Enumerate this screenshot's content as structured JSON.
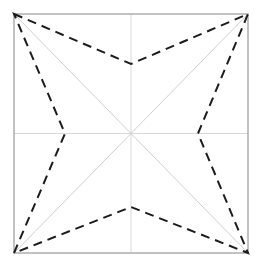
{
  "figure": {
    "type": "geometric-diagram",
    "canvas": {
      "width": 259,
      "height": 270,
      "background": "#ffffff"
    },
    "colors": {
      "background": "#ffffff",
      "square_border": "#9a9a9a",
      "diagonal_guide": "#cfcfcf",
      "axis_guide": "#d8d8d8",
      "dashed_star": "#1c1c1c"
    },
    "square": {
      "label": "bounding-square",
      "left": 14,
      "top": 14,
      "right": 248,
      "bottom": 253,
      "stroke_width": 1.2
    },
    "center": {
      "x": 131,
      "y": 133.5
    },
    "guides": {
      "diagonals": [
        {
          "label": "diagonal-tl-br",
          "x1": 14,
          "y1": 14,
          "x2": 248,
          "y2": 253
        },
        {
          "label": "diagonal-tr-bl",
          "x1": 248,
          "y1": 14,
          "x2": 14,
          "y2": 253
        }
      ],
      "axes": [
        {
          "label": "horizontal-center-line",
          "x1": 14,
          "y1": 133.5,
          "x2": 248,
          "y2": 133.5
        },
        {
          "label": "vertical-center-line",
          "x1": 131,
          "y1": 14,
          "x2": 131,
          "y2": 253
        }
      ]
    },
    "star": {
      "label": "dashed-four-pointed-star",
      "outer_points": [
        {
          "name": "corner-top-left",
          "x": 14,
          "y": 14
        },
        {
          "name": "corner-top-right",
          "x": 248,
          "y": 14
        },
        {
          "name": "corner-bottom-right",
          "x": 248,
          "y": 253
        },
        {
          "name": "corner-bottom-left",
          "x": 14,
          "y": 253
        }
      ],
      "inner_points": [
        {
          "name": "inner-top",
          "x": 131,
          "y": 64
        },
        {
          "name": "inner-right",
          "x": 198,
          "y": 133.5
        },
        {
          "name": "inner-bottom",
          "x": 131,
          "y": 207
        },
        {
          "name": "inner-left",
          "x": 65,
          "y": 133.5
        }
      ],
      "dash_pattern": "9 6",
      "stroke_width": 2.0,
      "path": "M 14 14 L 131 64 L 248 14 L 198 133.5 L 248 253 L 131 207 L 14 253 L 65 133.5 Z"
    }
  },
  "chart_data": {
    "type": "scatter",
    "xlabel": "",
    "ylabel": "",
    "xlim": [
      14,
      248
    ],
    "ylim": [
      14,
      253
    ],
    "grid": false,
    "legend": "none",
    "annotations": [
      "Outer vertices coincide with the square corners",
      "Inner vertices lie on the horizontal and vertical center lines",
      "Star outline drawn with a dashed black stroke",
      "Light gray guide lines: square border, both diagonals, horizontal and vertical medians"
    ],
    "series": [
      {
        "name": "star-outline",
        "style": "dashed",
        "color": "#1c1c1c",
        "x": [
          14,
          131,
          248,
          198,
          248,
          131,
          14,
          65,
          14
        ],
        "y": [
          14,
          64,
          14,
          133.5,
          253,
          207,
          253,
          133.5,
          14
        ]
      },
      {
        "name": "square-border",
        "style": "solid",
        "color": "#9a9a9a",
        "x": [
          14,
          248,
          248,
          14,
          14
        ],
        "y": [
          14,
          14,
          253,
          253,
          14
        ]
      },
      {
        "name": "diagonal-tl-br",
        "style": "solid",
        "color": "#cfcfcf",
        "x": [
          14,
          248
        ],
        "y": [
          14,
          253
        ]
      },
      {
        "name": "diagonal-tr-bl",
        "style": "solid",
        "color": "#cfcfcf",
        "x": [
          248,
          14
        ],
        "y": [
          14,
          253
        ]
      },
      {
        "name": "horizontal-median",
        "style": "solid",
        "color": "#d8d8d8",
        "x": [
          14,
          248
        ],
        "y": [
          133.5,
          133.5
        ]
      },
      {
        "name": "vertical-median",
        "style": "solid",
        "color": "#d8d8d8",
        "x": [
          131,
          131
        ],
        "y": [
          14,
          253
        ]
      }
    ]
  }
}
